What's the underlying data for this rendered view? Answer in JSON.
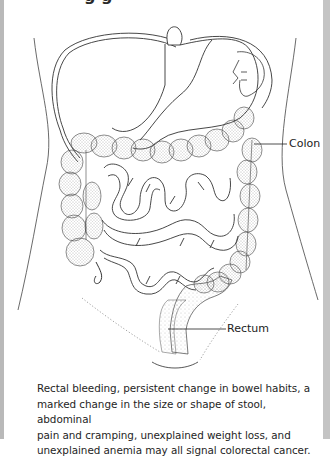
{
  "figure": {
    "heading_visible_fragment": "g g",
    "labels": {
      "colon": "Colon",
      "rectum": "Rectum"
    },
    "caption_lines": [
      "Rectal bleeding, persistent change in bowel habits, a",
      "marked change in the size or shape of stool, abdominal",
      "pain and cramping, unexplained weight loss, and",
      "unexplained anemia may all signal colorectal cancer."
    ]
  },
  "colors": {
    "frame": "#b9b9b9",
    "line": "#333333",
    "stipple": "#555555",
    "text": "#1e1e1e"
  }
}
